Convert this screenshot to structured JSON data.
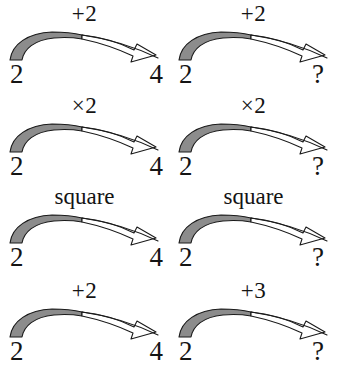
{
  "figure": {
    "type": "analogy-arrow-diagram",
    "colors": {
      "arrow_fill_shaded": "#8c8c8c",
      "arrow_fill_plain": "#ffffff",
      "arrow_outline": "#1a1a1a",
      "text": "#141414",
      "background": "#ffffff"
    },
    "rows": [
      {
        "id": "row-1",
        "left": {
          "operation_label": "+2",
          "operation_kind": "addition",
          "source_value": "2",
          "target_value": "4"
        },
        "right": {
          "operation_label": "+2",
          "operation_kind": "addition",
          "source_value": "2",
          "target_value": "?"
        }
      },
      {
        "id": "row-2",
        "left": {
          "operation_label": "×2",
          "operation_kind": "multiplication",
          "source_value": "2",
          "target_value": "4"
        },
        "right": {
          "operation_label": "×2",
          "operation_kind": "multiplication",
          "source_value": "2",
          "target_value": "?"
        }
      },
      {
        "id": "row-3",
        "left": {
          "operation_label": "square",
          "operation_kind": "square",
          "source_value": "2",
          "target_value": "4"
        },
        "right": {
          "operation_label": "square",
          "operation_kind": "square",
          "source_value": "2",
          "target_value": "?"
        }
      },
      {
        "id": "row-4",
        "left": {
          "operation_label": "+2",
          "operation_kind": "addition",
          "source_value": "2",
          "target_value": "4"
        },
        "right": {
          "operation_label": "+3",
          "operation_kind": "addition",
          "source_value": "2",
          "target_value": "?"
        }
      }
    ]
  }
}
